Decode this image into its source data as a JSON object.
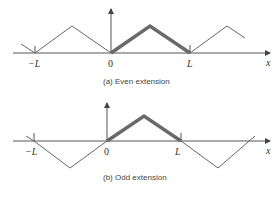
{
  "panels": [
    {
      "caption": "(a) Even extension",
      "labels": {
        "neg_L": "−L",
        "zero": "0",
        "L": "L",
        "x": "x"
      }
    },
    {
      "caption": "(b) Odd extension",
      "labels": {
        "neg_L": "−L",
        "zero": "0",
        "L": "L",
        "x": "x"
      }
    }
  ],
  "colors": {
    "axis": "#555555",
    "thin": "#666666",
    "thick": "#6a6a6a"
  }
}
